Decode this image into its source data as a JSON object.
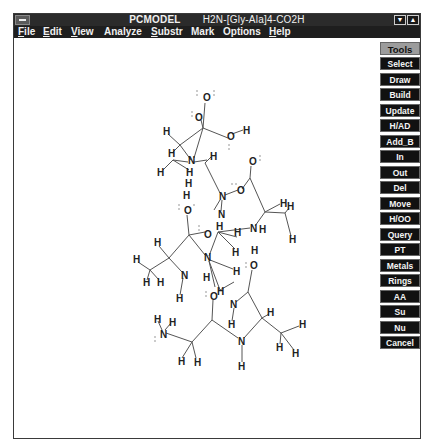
{
  "window": {
    "app_title": "PCMODEL",
    "document_title": "H2N-[Gly-Ala]4-CO2H",
    "minimize_icon": "triangle-down",
    "maximize_icon": "triangle-up"
  },
  "menubar": {
    "items": [
      {
        "label": "File",
        "underline": "F",
        "rest": "ile"
      },
      {
        "label": "Edit",
        "underline": "E",
        "rest": "dit"
      },
      {
        "label": "View",
        "underline": "V",
        "rest": "iew"
      },
      {
        "label": "Analyze",
        "underline": "",
        "rest": "Analyze"
      },
      {
        "label": "Substr",
        "underline": "S",
        "rest": "ubstr"
      },
      {
        "label": "Mark",
        "underline": "",
        "rest": "Mark"
      },
      {
        "label": "Options",
        "underline": "",
        "rest": "Options"
      },
      {
        "label": "Help",
        "underline": "H",
        "rest": "elp"
      }
    ]
  },
  "toolbar": {
    "header": "Tools",
    "buttons": [
      "Select",
      "Draw",
      "Build",
      "Update",
      "H/AD",
      "Add_B",
      "In",
      "Out",
      "Del",
      "Move",
      "H/OO",
      "Query",
      "PT",
      "Metals",
      "Rings",
      "AA",
      "Su",
      "Nu",
      "Cancel"
    ]
  },
  "molecule": {
    "name": "H2N-[Gly-Ala]4-CO2H",
    "atoms": [
      {
        "el": "O",
        "x": 206,
        "y": 98
      },
      {
        "el": "O",
        "x": 198,
        "y": 117
      },
      {
        "el": "O",
        "x": 231,
        "y": 136
      },
      {
        "el": "H",
        "x": 245,
        "y": 130
      },
      {
        "el": "H",
        "x": 166,
        "y": 131
      },
      {
        "el": "H",
        "x": 171,
        "y": 153
      },
      {
        "el": "N",
        "x": 191,
        "y": 160
      },
      {
        "el": "H",
        "x": 213,
        "y": 156
      },
      {
        "el": "H",
        "x": 160,
        "y": 172
      },
      {
        "el": "H",
        "x": 189,
        "y": 172
      },
      {
        "el": "H",
        "x": 188,
        "y": 183
      },
      {
        "el": "O",
        "x": 252,
        "y": 161
      },
      {
        "el": "N",
        "x": 222,
        "y": 196
      },
      {
        "el": "O",
        "x": 240,
        "y": 190
      },
      {
        "el": "H",
        "x": 282,
        "y": 203
      },
      {
        "el": "H",
        "x": 289,
        "y": 206
      },
      {
        "el": "H",
        "x": 186,
        "y": 195
      },
      {
        "el": "O",
        "x": 187,
        "y": 210
      },
      {
        "el": "N",
        "x": 221,
        "y": 214
      },
      {
        "el": "H",
        "x": 219,
        "y": 226
      },
      {
        "el": "O",
        "x": 207,
        "y": 234
      },
      {
        "el": "N",
        "x": 253,
        "y": 228
      },
      {
        "el": "H",
        "x": 262,
        "y": 229
      },
      {
        "el": "H",
        "x": 291,
        "y": 239
      },
      {
        "el": "H",
        "x": 157,
        "y": 242
      },
      {
        "el": "N",
        "x": 207,
        "y": 257
      },
      {
        "el": "H",
        "x": 237,
        "y": 232
      },
      {
        "el": "H",
        "x": 235,
        "y": 252
      },
      {
        "el": "H",
        "x": 136,
        "y": 259
      },
      {
        "el": "H",
        "x": 146,
        "y": 282
      },
      {
        "el": "H",
        "x": 160,
        "y": 282
      },
      {
        "el": "N",
        "x": 184,
        "y": 275
      },
      {
        "el": "H",
        "x": 206,
        "y": 277
      },
      {
        "el": "H",
        "x": 236,
        "y": 271
      },
      {
        "el": "H",
        "x": 254,
        "y": 250
      },
      {
        "el": "O",
        "x": 253,
        "y": 265
      },
      {
        "el": "H",
        "x": 179,
        "y": 298
      },
      {
        "el": "H",
        "x": 220,
        "y": 291
      },
      {
        "el": "O",
        "x": 213,
        "y": 296
      },
      {
        "el": "N",
        "x": 233,
        "y": 304
      },
      {
        "el": "H",
        "x": 270,
        "y": 312
      },
      {
        "el": "H",
        "x": 157,
        "y": 319
      },
      {
        "el": "H",
        "x": 172,
        "y": 322
      },
      {
        "el": "N",
        "x": 163,
        "y": 334
      },
      {
        "el": "H",
        "x": 231,
        "y": 324
      },
      {
        "el": "N",
        "x": 241,
        "y": 341
      },
      {
        "el": "H",
        "x": 302,
        "y": 324
      },
      {
        "el": "H",
        "x": 279,
        "y": 347
      },
      {
        "el": "H",
        "x": 295,
        "y": 353
      },
      {
        "el": "H",
        "x": 181,
        "y": 361
      },
      {
        "el": "H",
        "x": 197,
        "y": 362
      },
      {
        "el": "H",
        "x": 241,
        "y": 366
      }
    ]
  }
}
